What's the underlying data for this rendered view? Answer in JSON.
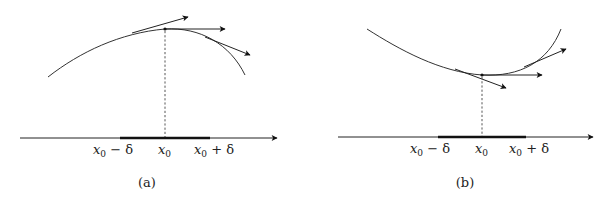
{
  "panels": [
    {
      "id": "a",
      "caption": "(a)",
      "description": "Concave curve with local maximum at x0; tangent arrows to the left, horizontal at x0, and to the right",
      "labels": {
        "left": {
          "var": "x",
          "sub": "0",
          "op": " − δ"
        },
        "center": {
          "var": "x",
          "sub": "0"
        },
        "right": {
          "var": "x",
          "sub": "0",
          "op": " + δ"
        }
      }
    },
    {
      "id": "b",
      "caption": "(b)",
      "description": "Convex curve with local minimum at x0; tangent arrows to the left, horizontal at x0, and to the right",
      "labels": {
        "left": {
          "var": "x",
          "sub": "0",
          "op": " − δ"
        },
        "center": {
          "var": "x",
          "sub": "0"
        },
        "right": {
          "var": "x",
          "sub": "0",
          "op": " + δ"
        }
      }
    }
  ],
  "colors": {
    "stroke": "#222222",
    "background": "#ffffff"
  }
}
